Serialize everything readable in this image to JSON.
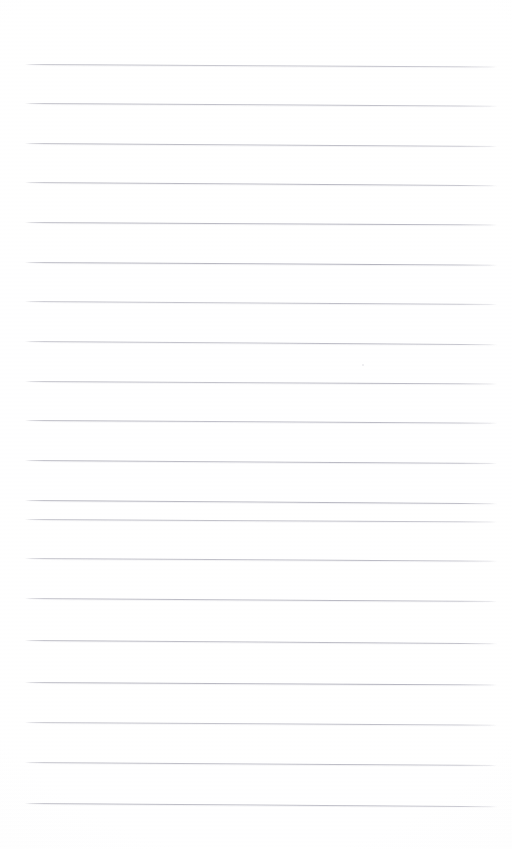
{
  "document": {
    "kind": "lined-notebook-page",
    "title": "",
    "body_text": "",
    "background_color": "#ffffff",
    "rule_color": "#b0b0ba",
    "page_width": 512,
    "page_height": 849,
    "is_blank": true,
    "visible_text": []
  },
  "ruling": {
    "line_count": 19,
    "line_spacing_px": 40,
    "first_line_y": 64,
    "line_left_x": 25,
    "line_right_x": 497,
    "line_thickness_px": 1,
    "slant_deg": 0.36,
    "margin_left_px": 25,
    "margin_right_px": 15,
    "margin_top_px": 64,
    "margin_bottom_px": 46,
    "lines": [
      {
        "index": 1,
        "y": 64,
        "label": ""
      },
      {
        "index": 2,
        "y": 103,
        "label": ""
      },
      {
        "index": 3,
        "y": 143,
        "label": ""
      },
      {
        "index": 4,
        "y": 182,
        "label": ""
      },
      {
        "index": 5,
        "y": 222,
        "label": ""
      },
      {
        "index": 6,
        "y": 262,
        "label": ""
      },
      {
        "index": 7,
        "y": 301,
        "label": ""
      },
      {
        "index": 8,
        "y": 341,
        "label": ""
      },
      {
        "index": 9,
        "y": 381,
        "label": ""
      },
      {
        "index": 10,
        "y": 420,
        "label": ""
      },
      {
        "index": 11,
        "y": 460,
        "label": ""
      },
      {
        "index": 12,
        "y": 500,
        "label": ""
      },
      {
        "index": 13,
        "y": 519,
        "label": ""
      },
      {
        "index": 14,
        "y": 558,
        "label": ""
      },
      {
        "index": 15,
        "y": 598,
        "label": ""
      },
      {
        "index": 16,
        "y": 640,
        "label": ""
      },
      {
        "index": 17,
        "y": 682,
        "label": ""
      },
      {
        "index": 18,
        "y": 722,
        "label": ""
      },
      {
        "index": 19,
        "y": 762,
        "label": ""
      },
      {
        "index": 20,
        "y": 803,
        "label": ""
      }
    ]
  },
  "artifacts": [
    {
      "name": "scan-speck",
      "x": 362,
      "y": 364,
      "size": 2
    }
  ]
}
